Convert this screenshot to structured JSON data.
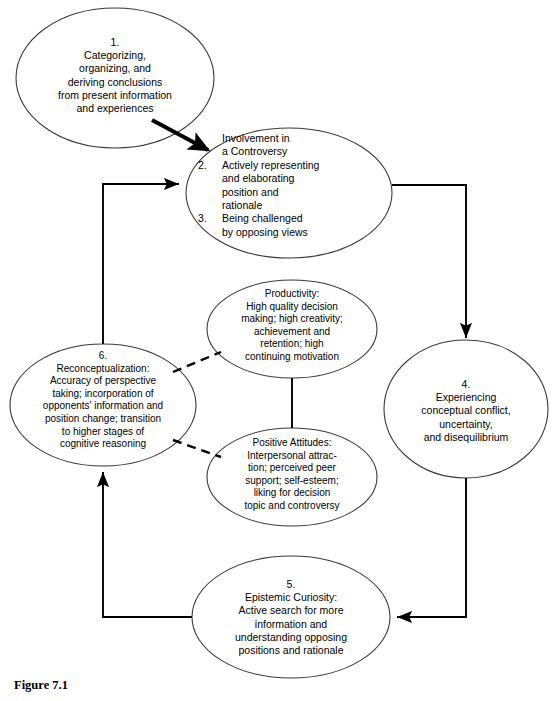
{
  "figure": {
    "caption": "Figure 7.1"
  },
  "colors": {
    "stroke": "#3a3a3a",
    "connector": "#000000",
    "background": "#ffffff",
    "text": "#000000"
  },
  "nodes": {
    "node1": {
      "number": "1.",
      "text": "1.\nCategorizing,\norganizing, and\nderiving conclusions\nfrom present information\nand experiences"
    },
    "node2": {
      "header": "Involvement in\na Controversy",
      "header_line1": "Involvement in",
      "header_line2": "a Controversy",
      "items": [
        {
          "number": "2.",
          "text": "Actively representing\nand elaborating\nposition and\nrationale"
        },
        {
          "number": "3.",
          "text": "Being challenged\nby opposing views"
        }
      ]
    },
    "node4": {
      "number": "4.",
      "text": "4.\nExperiencing\nconceptual conflict,\nuncertainty,\nand disequilibrium"
    },
    "node5": {
      "number": "5.",
      "text": "5.\nEpistemic Curiosity:\nActive search for more\ninformation and\nunderstanding opposing\npositions and rationale"
    },
    "node6": {
      "number": "6.",
      "text": "6.\nReconceptualization:\nAccuracy of perspective\ntaking; incorporation of\nopponents' information and\nposition change; transition\nto higher stages of\ncognitive reasoning"
    },
    "productivity": {
      "text": "Productivity:\nHigh quality decision\nmaking; high creativity;\nachievement and\nretention; high\ncontinuing motivation"
    },
    "positive_attitudes": {
      "text": "Positive Attitudes:\nInterpersonal attrac-\ntion; perceived peer\nsupport; self-esteem;\nliking for decision\ntopic and controversy"
    }
  },
  "connectors": [
    {
      "name": "node1-to-node2",
      "style": "solid-thick",
      "arrow": true
    },
    {
      "name": "node2-to-node4",
      "style": "solid",
      "arrow": true
    },
    {
      "name": "node4-to-node5",
      "style": "solid",
      "arrow": true
    },
    {
      "name": "node5-to-node6",
      "style": "solid",
      "arrow": true
    },
    {
      "name": "node6-to-node2",
      "style": "solid",
      "arrow": true
    },
    {
      "name": "node6-to-productivity",
      "style": "dashed",
      "arrow": false
    },
    {
      "name": "node6-to-positive-attitudes",
      "style": "dashed",
      "arrow": false
    },
    {
      "name": "productivity-to-positive-attitudes",
      "style": "solid",
      "arrow": false
    }
  ]
}
